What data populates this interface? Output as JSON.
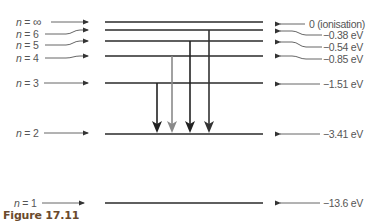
{
  "caption": "Figure 17.11",
  "colors": {
    "level_line": "#2a2a2a",
    "pointer": "#444444",
    "arrow_dark": "#222222",
    "arrow_gray": "#8a8a8a",
    "text": "#555555",
    "caption": "#6b4a2c"
  },
  "levels": [
    {
      "n_label": "n = ∞",
      "n": "∞",
      "energy_label": "0 (ionisation)",
      "energy_eV": 0,
      "y": 22
    },
    {
      "n_label": "n = 6",
      "n": "6",
      "energy_label": "−0.38 eV",
      "energy_eV": -0.38,
      "y": 30
    },
    {
      "n_label": "n = 5",
      "n": "5",
      "energy_label": "−0.54 eV",
      "energy_eV": -0.54,
      "y": 41
    },
    {
      "n_label": "n = 4",
      "n": "4",
      "energy_label": "−0.85 eV",
      "energy_eV": -0.85,
      "y": 56
    },
    {
      "n_label": "n = 3",
      "n": "3",
      "energy_label": "−1.51 eV",
      "energy_eV": -1.51,
      "y": 83
    },
    {
      "n_label": "n = 2",
      "n": "2",
      "energy_label": "−3.41 eV",
      "energy_eV": -3.41,
      "y": 134
    },
    {
      "n_label": "n = 1",
      "n": "1",
      "energy_label": "−13.6 eV",
      "energy_eV": -13.6,
      "y": 203
    }
  ],
  "transitions": [
    {
      "from_n": "3",
      "to_n": "2",
      "shade": "dark"
    },
    {
      "from_n": "4",
      "to_n": "2",
      "shade": "gray"
    },
    {
      "from_n": "5",
      "to_n": "2",
      "shade": "dark"
    },
    {
      "from_n": "6",
      "to_n": "2",
      "shade": "dark"
    }
  ],
  "labels": {
    "n_inf": "∞",
    "n6": "6",
    "n5": "5",
    "n4": "4",
    "n3": "3",
    "n2": "2",
    "n1": "1",
    "n_prefix": "n",
    "eq": " = ",
    "e_inf": "0 (ionisation)",
    "e6": "−0.38 eV",
    "e5": "−0.54 eV",
    "e4": "−0.85 eV",
    "e3": "−1.51 eV",
    "e2": "−3.41 eV",
    "e1": "−13.6 eV"
  }
}
